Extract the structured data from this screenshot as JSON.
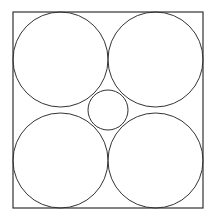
{
  "diagram": {
    "stroke_color": "#333333",
    "background": "#ffffff",
    "square": {
      "x": 13,
      "y": 12,
      "width": 190,
      "height": 196
    },
    "large_circles": [
      {
        "cx": 60.5,
        "cy": 59.5,
        "r": 47.5
      },
      {
        "cx": 155.5,
        "cy": 59.5,
        "r": 47.5
      },
      {
        "cx": 60.5,
        "cy": 160.5,
        "r": 47.5
      },
      {
        "cx": 155.5,
        "cy": 160.5,
        "r": 47.5
      }
    ],
    "small_circle": {
      "cx": 108,
      "cy": 110,
      "r": 20
    }
  }
}
